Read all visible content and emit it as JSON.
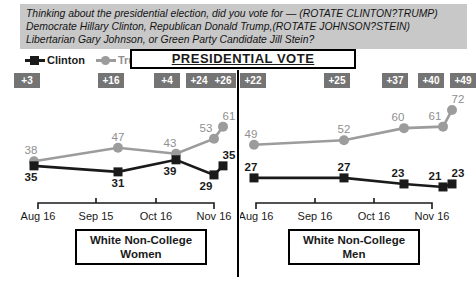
{
  "question": {
    "line1": "Thinking about the presidential election, did you vote for — (ROTATE CLINTON?TRUMP)",
    "line2": "Democrate Hillary Clinton, Republican Donald Trump,(ROTATE JOHNSON?STEIN)",
    "line3": "Libertarian Gary Johnson, or Green Party Candidate Jill Stein?"
  },
  "title": "PRESIDENTIAL VOTE",
  "legend": [
    {
      "label": "Clinton",
      "marker": "square",
      "color": "#1a1a1a"
    },
    {
      "label": "Trump",
      "marker": "circle",
      "color": "#9c9c9c"
    }
  ],
  "colors": {
    "clinton": "#1a1a1a",
    "trump": "#9c9c9c",
    "trump_label": "#8f8f8f",
    "badge_bg": "#747474",
    "badge_text": "#ffffff",
    "question_bg": "#c8c8c8"
  },
  "chart_data": [
    {
      "type": "line",
      "panel_label": "White Non-College Women",
      "categories": [
        "Aug 16",
        "Sep 15",
        "Oct 16",
        "Nov 16"
      ],
      "series": [
        {
          "name": "Clinton",
          "marker": "square",
          "color": "#1a1a1a",
          "label_color": "#1a1a1a",
          "label_bold": true,
          "values": [
            35,
            31,
            39,
            29,
            35
          ],
          "label_pos": [
            "below",
            "below",
            "below",
            "below",
            "above"
          ]
        },
        {
          "name": "Trump",
          "marker": "circle",
          "color": "#9c9c9c",
          "label_color": "#8f8f8f",
          "label_bold": false,
          "values": [
            38,
            47,
            43,
            53,
            61
          ],
          "label_pos": [
            "above",
            "above",
            "above",
            "above",
            "above"
          ]
        }
      ],
      "margins": [
        "+3",
        "+16",
        "+4",
        "+24",
        "+26"
      ],
      "ylim": [
        15,
        80
      ],
      "grid": false,
      "legend_position": "top-left"
    },
    {
      "type": "line",
      "panel_label": "White Non-College Men",
      "categories": [
        "Aug 16",
        "Sep 16",
        "Oct 16",
        "Nov 16"
      ],
      "series": [
        {
          "name": "Clinton",
          "marker": "square",
          "color": "#1a1a1a",
          "label_color": "#1a1a1a",
          "label_bold": true,
          "values": [
            27,
            27,
            23,
            21,
            23
          ],
          "label_pos": [
            "above",
            "above",
            "above",
            "above",
            "above"
          ]
        },
        {
          "name": "Trump",
          "marker": "circle",
          "color": "#9c9c9c",
          "label_color": "#8f8f8f",
          "label_bold": false,
          "values": [
            49,
            52,
            60,
            61,
            72
          ],
          "label_pos": [
            "above",
            "above",
            "above",
            "above",
            "above"
          ]
        }
      ],
      "margins": [
        "+22",
        "+25",
        "+37",
        "+40",
        "+49"
      ],
      "ylim": [
        15,
        80
      ],
      "grid": false,
      "legend_position": "top-left"
    }
  ]
}
